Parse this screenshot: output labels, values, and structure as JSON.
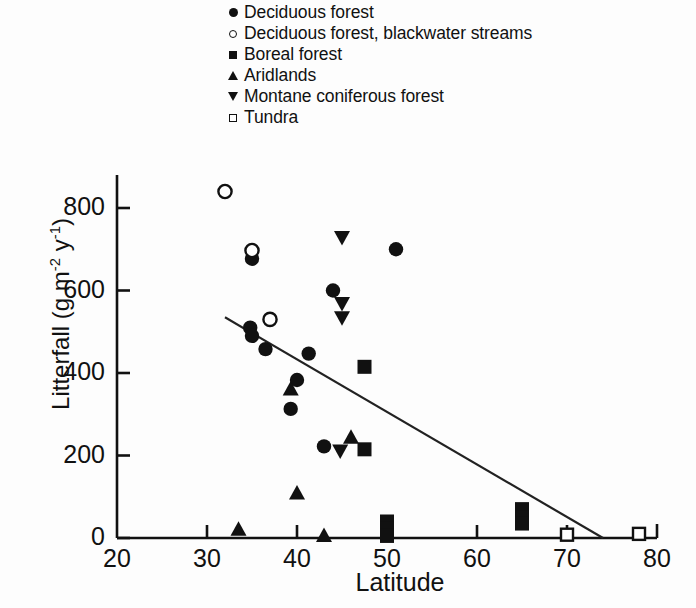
{
  "chart_data": {
    "type": "scatter",
    "title": "",
    "xlabel": "Latitude",
    "ylabel": "Litterfall (g m-2 y-1)",
    "ylabel_parts": {
      "prefix": "Litterfall (g m",
      "exp1": "-2",
      "mid": " y",
      "exp2": "-1",
      "suffix": ")"
    },
    "xlim": [
      20,
      80
    ],
    "ylim": [
      0,
      880
    ],
    "xticks": [
      20,
      30,
      40,
      50,
      60,
      70,
      80
    ],
    "xtick_labels": [
      "20",
      "30",
      "40",
      "50",
      "60",
      "70",
      "80"
    ],
    "yticks": [
      0,
      200,
      400,
      600,
      800
    ],
    "ytick_labels": [
      "0",
      "200",
      "400",
      "600",
      "800"
    ],
    "grid": false,
    "legend_position": "top-center",
    "series": [
      {
        "name": "Deciduous forest",
        "marker": "circle-filled",
        "points": [
          [
            35.0,
            677
          ],
          [
            36.5,
            458
          ],
          [
            34.8,
            510
          ],
          [
            35.0,
            490
          ],
          [
            39.3,
            313
          ],
          [
            40.0,
            383
          ],
          [
            41.3,
            447
          ],
          [
            44.0,
            600
          ],
          [
            51.0,
            700
          ],
          [
            43.0,
            222
          ]
        ]
      },
      {
        "name": "Deciduous forest, blackwater streams",
        "marker": "circle-open",
        "points": [
          [
            32.0,
            840
          ],
          [
            35.0,
            697
          ],
          [
            37.0,
            530
          ]
        ]
      },
      {
        "name": "Boreal forest",
        "marker": "square-filled",
        "points": [
          [
            47.5,
            415
          ],
          [
            47.5,
            215
          ],
          [
            50.0,
            40
          ],
          [
            50.0,
            22
          ],
          [
            50.0,
            5
          ],
          [
            65.0,
            70
          ],
          [
            65.0,
            50
          ],
          [
            65.0,
            35
          ]
        ]
      },
      {
        "name": "Aridlands",
        "marker": "triangle-up",
        "points": [
          [
            33.5,
            20
          ],
          [
            39.3,
            360
          ],
          [
            40.0,
            108
          ],
          [
            43.0,
            5
          ],
          [
            46.0,
            243
          ]
        ]
      },
      {
        "name": "Montane coniferous forest",
        "marker": "triangle-down",
        "points": [
          [
            45.0,
            730
          ],
          [
            45.0,
            570
          ],
          [
            45.0,
            535
          ],
          [
            44.8,
            212
          ]
        ]
      },
      {
        "name": "Tundra",
        "marker": "square-open",
        "points": [
          [
            70.0,
            8
          ],
          [
            78.0,
            10
          ]
        ]
      }
    ],
    "trendline": {
      "name": "regression line",
      "x_start": 32.0,
      "y_start": 535,
      "x_end": 74.0,
      "y_end": 0
    }
  },
  "legend": {
    "items": [
      {
        "label": "Deciduous forest",
        "marker": "circle-filled"
      },
      {
        "label": "Deciduous forest, blackwater streams",
        "marker": "circle-open"
      },
      {
        "label": "Boreal forest",
        "marker": "square-filled"
      },
      {
        "label": "Aridlands",
        "marker": "triangle-up"
      },
      {
        "label": "Montane coniferous forest",
        "marker": "triangle-down"
      },
      {
        "label": "Tundra",
        "marker": "square-open"
      }
    ]
  }
}
